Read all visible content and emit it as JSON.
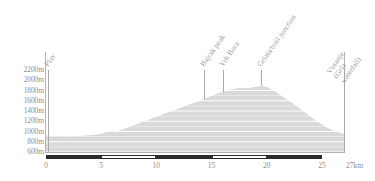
{
  "chart_data": {
    "type": "area",
    "title": "",
    "subtitle": "",
    "xlabel": "",
    "ylabel": "",
    "unit_x": "km",
    "unit_y": "m",
    "xlim": [
      0,
      27
    ],
    "ylim": [
      600,
      2200
    ],
    "grid": true,
    "grid_orientation": "horizontal",
    "legend": "none",
    "x_ticks": [
      "0",
      "5",
      "10",
      "15",
      "20",
      "25",
      "27"
    ],
    "x_tick_values": [
      0,
      5,
      10,
      15,
      20,
      25,
      27
    ],
    "x_axis_unit_label": "27km",
    "y_ticks": [
      "600m",
      "800m",
      "1000m",
      "1200m",
      "1400m",
      "1600m",
      "1800m",
      "2000m",
      "2200m"
    ],
    "y_tick_values": [
      600,
      800,
      1000,
      1200,
      1400,
      1600,
      1800,
      2000,
      2200
    ],
    "series": [
      {
        "name": "elevation",
        "x": [
          0.0,
          0.4,
          0.9,
          1.5,
          2.1,
          2.7,
          3.3,
          3.9,
          4.5,
          5.1,
          5.6,
          6.0,
          6.4,
          6.9,
          7.4,
          7.9,
          8.4,
          8.9,
          9.4,
          9.9,
          10.4,
          10.9,
          11.4,
          11.9,
          12.4,
          12.9,
          13.4,
          13.9,
          14.3,
          14.8,
          15.3,
          15.8,
          16.2,
          16.7,
          17.2,
          17.7,
          18.2,
          18.7,
          19.2,
          19.6,
          20.1,
          20.6,
          21.1,
          21.6,
          22.1,
          22.6,
          23.1,
          23.6,
          24.1,
          24.6,
          25.1,
          25.6,
          26.1,
          26.6,
          27.0
        ],
        "y": [
          920,
          915,
          910,
          905,
          905,
          910,
          915,
          925,
          935,
          960,
          1000,
          1015,
          1010,
          1035,
          1075,
          1115,
          1155,
          1200,
          1240,
          1280,
          1320,
          1360,
          1400,
          1440,
          1480,
          1520,
          1555,
          1600,
          1640,
          1680,
          1720,
          1760,
          1790,
          1820,
          1840,
          1855,
          1845,
          1860,
          1880,
          1890,
          1860,
          1800,
          1730,
          1660,
          1590,
          1510,
          1430,
          1350,
          1270,
          1190,
          1120,
          1060,
          1010,
          975,
          955
        ]
      }
    ],
    "annotations": [
      {
        "label": "Plav",
        "x_km": 0.2
      },
      {
        "label": "Bajrak peak",
        "x_km": 14.3
      },
      {
        "label": "Vrh Bora",
        "x_km": 16.0
      },
      {
        "label": "Grlata/trail junction",
        "x_km": 19.5
      },
      {
        "label": "Vusanje\n(Grla\nwaterfall)",
        "x_km": 27.0
      }
    ],
    "scalebar_segments": [
      {
        "from_km": 0,
        "to_km": 5,
        "style": "fill"
      },
      {
        "from_km": 5,
        "to_km": 10,
        "style": "empty"
      },
      {
        "from_km": 10,
        "to_km": 15,
        "style": "fill"
      },
      {
        "from_km": 15,
        "to_km": 20,
        "style": "empty"
      },
      {
        "from_km": 20,
        "to_km": 25,
        "style": "fill"
      }
    ],
    "colors": {
      "fill": "#d9d9d9",
      "grid": "#ffffff",
      "axis": "#b3b3b3",
      "text": "#8d8d8d",
      "marker": "#a8a8a8",
      "scalebar": "#2b2b2b",
      "background": "#ffffff"
    }
  }
}
